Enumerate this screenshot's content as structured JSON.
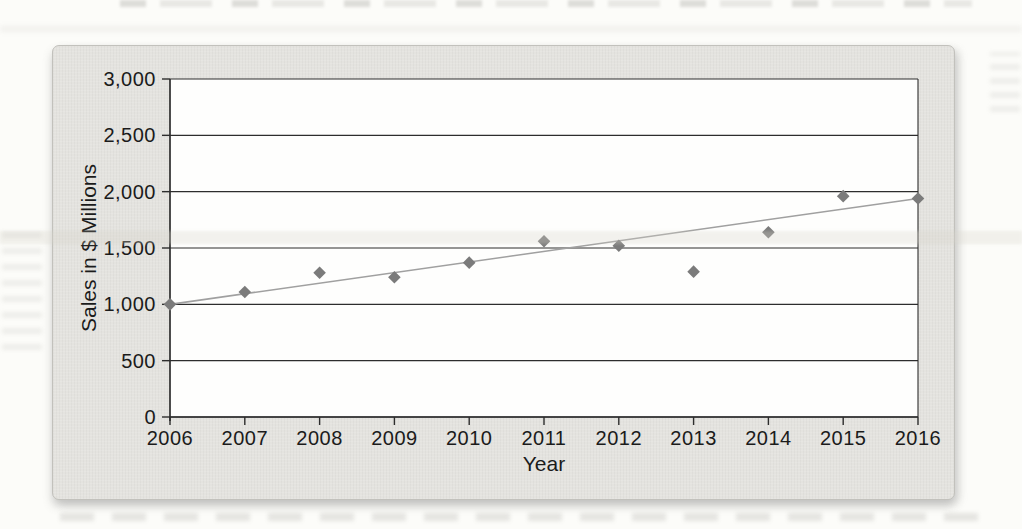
{
  "page": {
    "background": "#fcfcf9",
    "card_background": "#e4e3df",
    "plot_background": "#fefefd",
    "gridline_color": "#2d2d2d",
    "text_color": "#1b1b1b"
  },
  "chart_data": {
    "type": "scatter",
    "title": "",
    "xlabel": "Year",
    "ylabel": "Sales in $ Millions",
    "x": [
      2006,
      2007,
      2008,
      2009,
      2010,
      2011,
      2012,
      2013,
      2014,
      2015,
      2016
    ],
    "series": [
      {
        "name": "Annual sales",
        "marker": "diamond",
        "color": "#7b7b7b",
        "values": [
          1000,
          1110,
          1280,
          1240,
          1370,
          1560,
          1520,
          1290,
          1640,
          1960,
          1940
        ]
      }
    ],
    "trend_line": {
      "color": "#a0a0a0",
      "start": {
        "x": 2006,
        "y": 1000
      },
      "end": {
        "x": 2016,
        "y": 1940
      }
    },
    "ylim": [
      0,
      3000
    ],
    "ytick_interval": 500,
    "ytick_labels": [
      "0",
      "500",
      "1,000",
      "1,500",
      "2,000",
      "2,500",
      "3,000"
    ],
    "xtick_labels": [
      "2006",
      "2007",
      "2008",
      "2009",
      "2010",
      "2011",
      "2012",
      "2013",
      "2014",
      "2015",
      "2016"
    ],
    "grid": "horizontal",
    "legend": "none"
  }
}
